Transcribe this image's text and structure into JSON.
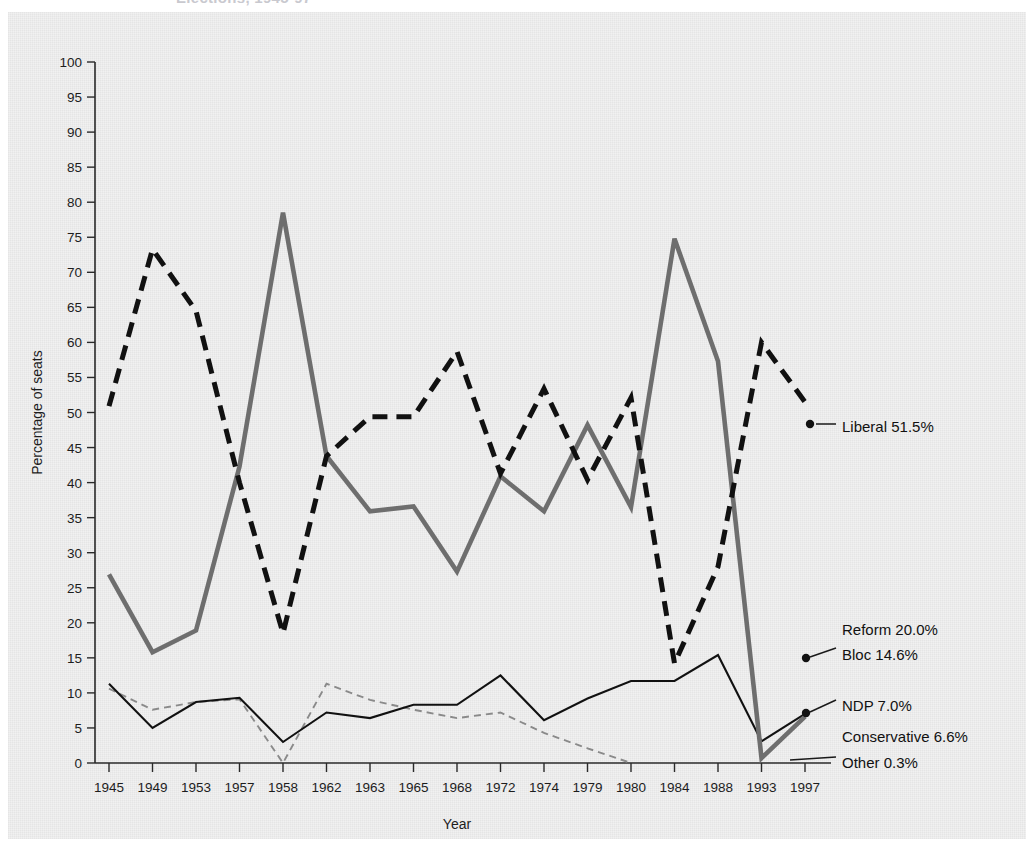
{
  "figure": {
    "title_partial": "Elections, 1945-97",
    "background_color": "#f1f1f1",
    "page_color": "#ffffff"
  },
  "chart_data": {
    "type": "line",
    "title": "Elections, 1945-97",
    "xlabel": "Year",
    "ylabel": "Percentage of seats",
    "ylim": [
      0,
      100
    ],
    "ytick_step": 5,
    "yticks": [
      "0",
      "5",
      "10",
      "15",
      "20",
      "25",
      "30",
      "35",
      "40",
      "45",
      "50",
      "55",
      "60",
      "65",
      "70",
      "75",
      "80",
      "85",
      "90",
      "95",
      "100"
    ],
    "grid": false,
    "legend": "inline-annotations-right",
    "categories": [
      "1945",
      "1949",
      "1953",
      "1957",
      "1958",
      "1962",
      "1963",
      "1965",
      "1968",
      "1972",
      "1974",
      "1979",
      "1980",
      "1984",
      "1988",
      "1993",
      "1997"
    ],
    "series": [
      {
        "name": "Liberal",
        "style": "thick-dashed-black",
        "color": "#111111",
        "values": [
          50.9,
          73.3,
          64.5,
          40.0,
          18.5,
          43.8,
          49.4,
          49.4,
          58.7,
          41.3,
          53.4,
          40.4,
          52.1,
          14.2,
          28.0,
          60.0,
          51.5
        ]
      },
      {
        "name": "Conservative",
        "style": "thick-solid-gray",
        "color": "#6e6e6e",
        "values": [
          26.9,
          15.8,
          18.9,
          42.3,
          78.5,
          43.8,
          35.9,
          36.6,
          27.3,
          40.9,
          35.9,
          48.2,
          36.5,
          74.8,
          57.3,
          0.7,
          6.6
        ]
      },
      {
        "name": "NDP",
        "style": "thin-solid-black",
        "color": "#111111",
        "values": [
          11.3,
          5.0,
          8.7,
          9.3,
          3.0,
          7.2,
          6.4,
          8.3,
          8.3,
          12.5,
          6.1,
          9.2,
          11.7,
          11.7,
          15.4,
          3.1,
          7.0
        ]
      },
      {
        "name": "Other",
        "style": "thin-dashed-gray",
        "color": "#8a8a8a",
        "values": [
          10.6,
          7.6,
          8.7,
          9.1,
          0.0,
          11.3,
          9.0,
          7.6,
          6.4,
          7.2,
          4.3,
          2.1,
          0.0,
          0.0,
          0.0,
          0.0,
          0.3
        ]
      }
    ],
    "annotations": [
      {
        "label": "Liberal 51.5%",
        "value": 51.5,
        "at_year": "1997",
        "has_leader": true,
        "has_marker": true
      },
      {
        "label": "Reform 20.0%",
        "value": 20.0,
        "at_year": "1997",
        "has_leader": false,
        "has_marker": false
      },
      {
        "label": "Bloc 14.6%",
        "value": 14.6,
        "at_year": "1997",
        "has_leader": true,
        "has_marker": true
      },
      {
        "label": "NDP 7.0%",
        "value": 7.0,
        "at_year": "1997",
        "has_leader": true,
        "has_marker": true
      },
      {
        "label": "Conservative 6.6%",
        "value": 6.6,
        "at_year": "1997",
        "has_leader": false,
        "has_marker": false
      },
      {
        "label": "Other 0.3%",
        "value": 0.3,
        "at_year": "1997",
        "has_leader": true,
        "has_marker": false
      }
    ]
  }
}
